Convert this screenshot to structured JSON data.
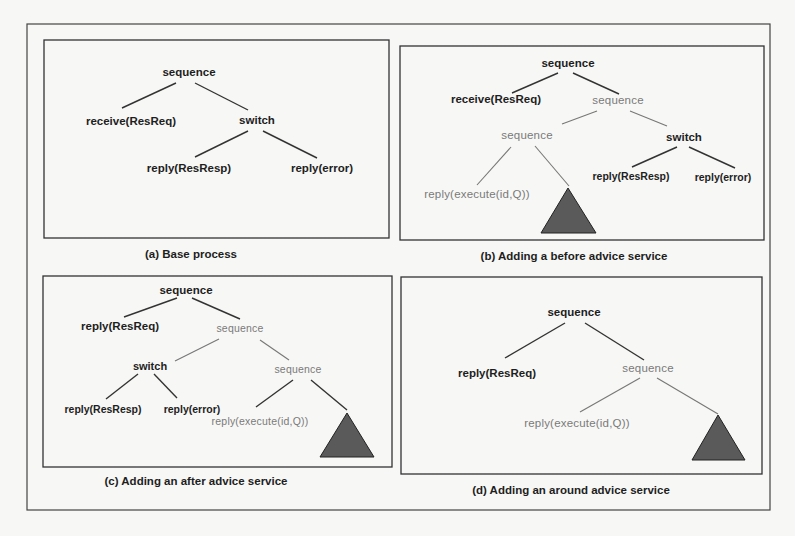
{
  "figure": {
    "colors": {
      "background": "#f7f7f5",
      "dark_text": "#1e1e1e",
      "gray_text": "#7a7a7a",
      "triangle_fill": "#5a5a5a"
    },
    "panels": [
      {
        "id": "a",
        "caption": "(a) Base process",
        "nodes": [
          {
            "label": "sequence",
            "style": "dark"
          },
          {
            "label": "receive(ResReq)",
            "style": "dark"
          },
          {
            "label": "switch",
            "style": "dark"
          },
          {
            "label": "reply(ResResp)",
            "style": "dark"
          },
          {
            "label": "reply(error)",
            "style": "dark"
          }
        ]
      },
      {
        "id": "b",
        "caption": "(b) Adding a before advice service",
        "nodes": [
          {
            "label": "sequence",
            "style": "dark"
          },
          {
            "label": "receive(ResReq)",
            "style": "dark"
          },
          {
            "label": "sequence",
            "style": "gray"
          },
          {
            "label": "sequence",
            "style": "gray"
          },
          {
            "label": "switch",
            "style": "dark"
          },
          {
            "label": "reply(execute(id,Q))",
            "style": "gray"
          },
          {
            "label": "reply(ResResp)",
            "style": "dark"
          },
          {
            "label": "reply(error)",
            "style": "dark"
          }
        ],
        "subtree": "triangle"
      },
      {
        "id": "c",
        "caption": "(c) Adding an after advice service",
        "nodes": [
          {
            "label": "sequence",
            "style": "dark"
          },
          {
            "label": "reply(ResReq)",
            "style": "dark"
          },
          {
            "label": "sequence",
            "style": "gray"
          },
          {
            "label": "switch",
            "style": "dark"
          },
          {
            "label": "sequence",
            "style": "gray"
          },
          {
            "label": "reply(ResResp)",
            "style": "dark"
          },
          {
            "label": "reply(error)",
            "style": "dark"
          },
          {
            "label": "reply(execute(id,Q))",
            "style": "gray"
          }
        ],
        "subtree": "triangle"
      },
      {
        "id": "d",
        "caption": "(d) Adding an around advice service",
        "nodes": [
          {
            "label": "sequence",
            "style": "dark"
          },
          {
            "label": "reply(ResReq)",
            "style": "dark"
          },
          {
            "label": "sequence",
            "style": "gray"
          },
          {
            "label": "reply(execute(id,Q))",
            "style": "gray"
          }
        ],
        "subtree": "triangle"
      }
    ]
  }
}
